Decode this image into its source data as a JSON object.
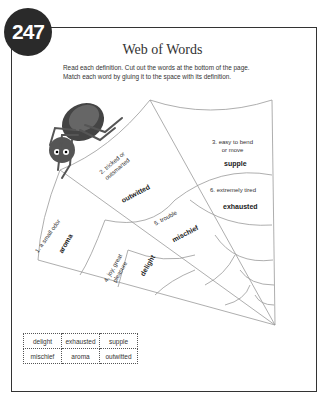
{
  "page": {
    "number": "247",
    "title": "Web of Words",
    "instructions": "Read each definition. Cut out the words at the bottom of the page. Match each word by gluing it to the space with its definition."
  },
  "definitions": [
    {
      "num": "1.",
      "text": "a small odor",
      "answer": "aroma"
    },
    {
      "num": "2.",
      "text": "tricked or outsmarted",
      "answer": "outwitted"
    },
    {
      "num": "3.",
      "text": "easy to bend or move",
      "answer": "supple"
    },
    {
      "num": "4.",
      "text": "joy, great pleasure",
      "answer": "delight"
    },
    {
      "num": "5.",
      "text": "trouble",
      "answer": "mischief"
    },
    {
      "num": "6.",
      "text": "extremely tired",
      "answer": "exhausted"
    }
  ],
  "labels": {
    "d1": "1. a small odor",
    "d2a": "2. tricked or",
    "d2b": "outsmarted",
    "d3a": "3. easy to bend",
    "d3b": "or move",
    "d4a": "4. joy, great",
    "d4b": "pleasure",
    "d5": "5. trouble",
    "d6": "6. extremely tired"
  },
  "word_bank": [
    [
      "delight",
      "exhausted",
      "supple"
    ],
    [
      "mischief",
      "aroma",
      "outwitted"
    ]
  ],
  "colors": {
    "badge": "#2a2a2a",
    "border": "#333333",
    "web": "#999999"
  }
}
